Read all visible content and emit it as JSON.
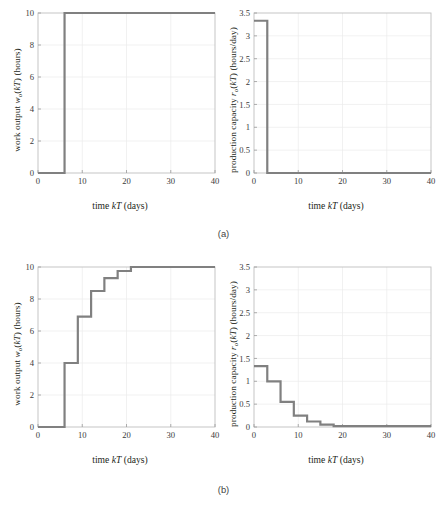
{
  "figure": {
    "subfigure_labels": [
      {
        "name": "panel-a",
        "text": "(a)"
      },
      {
        "name": "panel-b",
        "text": "(b)"
      }
    ]
  },
  "axis_text": {
    "xlabel_prefix": "time ",
    "xlabel_var": "kT",
    "xlabel_suffix": " (days)",
    "work_output_prefix": "work output ",
    "work_output_var": "w",
    "work_output_sub": "o",
    "work_output_mid": "(",
    "work_output_var2": "kT",
    "work_output_suffix": ") (hours)",
    "capacity_prefix": "production capacity ",
    "capacity_var": "r",
    "capacity_sub": "o",
    "capacity_mid": "(",
    "capacity_var2": "kT",
    "capacity_suffix": ") (hours/day)"
  },
  "style": {
    "line_color": "#808080",
    "frame_color": "#bfbfbf",
    "grid_color": "#ebebeb",
    "line_width": 2.2
  },
  "chart_data": [
    {
      "id": "a-work-output",
      "type": "line",
      "title": "",
      "xlabel": "time kT (days)",
      "ylabel": "work output w_o(kT) (hours)",
      "xlim": [
        0,
        40
      ],
      "ylim": [
        0,
        10
      ],
      "xticks": [
        0,
        10,
        20,
        30,
        40
      ],
      "xticklabels": [
        "0",
        "10",
        "20",
        "30",
        "40"
      ],
      "yticks": [
        0,
        2,
        4,
        6,
        8,
        10
      ],
      "yticklabels": [
        "0",
        "2",
        "4",
        "6",
        "8",
        "10"
      ],
      "grid": true,
      "drawstyle": "steps-post",
      "x": [
        0,
        6,
        40
      ],
      "y": [
        0,
        10,
        10
      ]
    },
    {
      "id": "a-production-capacity",
      "type": "line",
      "title": "",
      "xlabel": "time kT (days)",
      "ylabel": "production capacity r_o(kT) (hours/day)",
      "xlim": [
        0,
        40
      ],
      "ylim": [
        0,
        3.5
      ],
      "xticks": [
        0,
        10,
        20,
        30,
        40
      ],
      "xticklabels": [
        "0",
        "10",
        "20",
        "30",
        "40"
      ],
      "yticks": [
        0,
        0.5,
        1,
        1.5,
        2,
        2.5,
        3,
        3.5
      ],
      "yticklabels": [
        "0",
        "0.5",
        "1",
        "1.5",
        "2",
        "2.5",
        "3",
        "3.5"
      ],
      "grid": true,
      "drawstyle": "steps-post",
      "x": [
        0,
        3,
        40
      ],
      "y": [
        3.33,
        0,
        0
      ]
    },
    {
      "id": "b-work-output",
      "type": "line",
      "title": "",
      "xlabel": "time kT (days)",
      "ylabel": "work output w_o(kT) (hours)",
      "xlim": [
        0,
        40
      ],
      "ylim": [
        0,
        10
      ],
      "xticks": [
        0,
        10,
        20,
        30,
        40
      ],
      "xticklabels": [
        "0",
        "10",
        "20",
        "30",
        "40"
      ],
      "yticks": [
        0,
        2,
        4,
        6,
        8,
        10
      ],
      "yticklabels": [
        "0",
        "2",
        "4",
        "6",
        "8",
        "10"
      ],
      "grid": true,
      "drawstyle": "steps-post",
      "x": [
        0,
        6,
        9,
        12,
        15,
        18,
        21,
        40
      ],
      "y": [
        0,
        4,
        6.9,
        8.5,
        9.3,
        9.75,
        10,
        10
      ]
    },
    {
      "id": "b-production-capacity",
      "type": "line",
      "title": "",
      "xlabel": "time kT (days)",
      "ylabel": "production capacity r_o(kT) (hours/day)",
      "xlim": [
        0,
        40
      ],
      "ylim": [
        0,
        3.5
      ],
      "xticks": [
        0,
        10,
        20,
        30,
        40
      ],
      "xticklabels": [
        "0",
        "10",
        "20",
        "30",
        "40"
      ],
      "yticks": [
        0,
        0.5,
        1,
        1.5,
        2,
        2.5,
        3,
        3.5
      ],
      "yticklabels": [
        "0",
        "0.5",
        "1",
        "1.5",
        "2",
        "2.5",
        "3",
        "3.5"
      ],
      "grid": true,
      "drawstyle": "steps-post",
      "x": [
        0,
        3,
        6,
        9,
        12,
        15,
        18,
        40
      ],
      "y": [
        1.33,
        1.0,
        0.55,
        0.25,
        0.12,
        0.05,
        0.02,
        0.02
      ]
    }
  ]
}
